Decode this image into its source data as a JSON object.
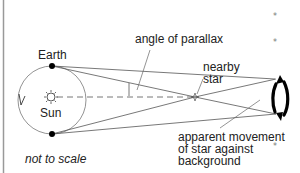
{
  "diagram": {
    "labels": {
      "earth": "Earth",
      "sun": "Sun",
      "angle": "angle of parallax",
      "nearby_star_line1": "nearby",
      "nearby_star_line2": "star",
      "apparent_line1": "apparent movement",
      "apparent_line2": "of star against",
      "apparent_line3": "background",
      "scale_note": "not to scale"
    },
    "icons": {
      "sun": "sun-icon",
      "earth": "earth-dot-icon",
      "nearby_star": "star-icon",
      "background_star": "small-star-icon",
      "apparent_movement": "curved-double-arrow-icon"
    },
    "colors": {
      "line": "#555555",
      "text": "#222222",
      "dot": "#000000",
      "background": "#ffffff"
    }
  }
}
